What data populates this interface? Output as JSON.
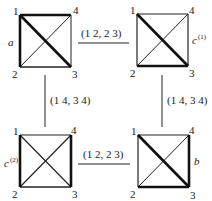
{
  "diagram": {
    "colors": {
      "stroke": "#222222",
      "background": "#ffffff"
    },
    "nodes": [
      {
        "id": "a",
        "label": "a",
        "label_sup": "",
        "vertex_labels": [
          "1",
          "2",
          "3",
          "4"
        ],
        "bold_edges": [
          "1-4",
          "1-2",
          "1-3"
        ],
        "thin_edges": [
          "2-3",
          "3-4",
          "2-4"
        ]
      },
      {
        "id": "c1",
        "label": "c",
        "label_sup": "(1)",
        "vertex_labels": [
          "1",
          "2",
          "3",
          "4"
        ],
        "bold_edges": [
          "1-3",
          "2-3"
        ],
        "thin_edges": [
          "1-4",
          "1-2",
          "3-4",
          "2-4"
        ]
      },
      {
        "id": "c2",
        "label": "c",
        "label_sup": "(2)",
        "vertex_labels": [
          "1",
          "2",
          "3",
          "4"
        ],
        "bold_edges": [
          "1-2",
          "3-4"
        ],
        "thin_edges": [
          "1-4",
          "2-3",
          "1-3",
          "2-4"
        ]
      },
      {
        "id": "b",
        "label": "b",
        "label_sup": "",
        "vertex_labels": [
          "1",
          "2",
          "3",
          "4"
        ],
        "bold_edges": [
          "1-3",
          "2-3",
          "3-4"
        ],
        "thin_edges": [
          "1-4",
          "1-2",
          "2-4"
        ]
      }
    ],
    "edges": [
      {
        "from": "a",
        "to": "c1",
        "label": "(1 2, 2 3)"
      },
      {
        "from": "a",
        "to": "c2",
        "label": "(1 4, 3 4)"
      },
      {
        "from": "c1",
        "to": "b",
        "label": "(1 4, 3 4)"
      },
      {
        "from": "c2",
        "to": "b",
        "label": "(1 2, 2 3)"
      }
    ]
  }
}
